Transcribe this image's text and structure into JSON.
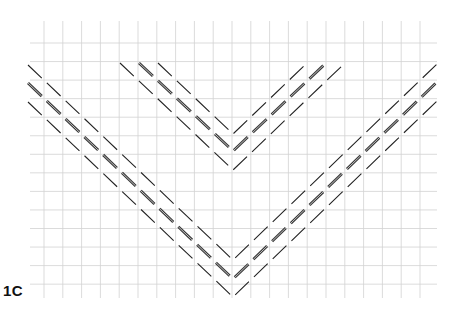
{
  "figure": {
    "label": "1C",
    "background": "#ffffff",
    "grid": {
      "color": "#d2d2d2",
      "vertical_x_start": 44,
      "vertical_spacing": 18.8,
      "vertical_count": 21,
      "vertical_y_range": [
        21,
        298
      ],
      "horizontal_y_start": 43,
      "horizontal_spacing": 18.55,
      "horizontal_count": 14,
      "horizontal_x_range": [
        30,
        437
      ]
    },
    "chevrons": [
      {
        "name": "inner-chevron",
        "lines": [
          {
            "role": "outer",
            "points": [
              [
                120,
                63
              ],
              [
                233,
                170
              ],
              [
                345,
                63
              ]
            ],
            "style": "thin"
          },
          {
            "role": "middle",
            "points": [
              [
                139,
                63
              ],
              [
                233,
                151
              ],
              [
                326,
                63
              ]
            ],
            "style": "double"
          },
          {
            "role": "inner",
            "points": [
              [
                158,
                63
              ],
              [
                233,
                134
              ],
              [
                307,
                63
              ]
            ],
            "style": "thin"
          }
        ]
      },
      {
        "name": "outer-chevron",
        "lines": [
          {
            "role": "top",
            "points": [
              [
                28,
                65
              ],
              [
                233,
                260
              ],
              [
                437,
                64
              ]
            ],
            "style": "thin"
          },
          {
            "role": "middle",
            "points": [
              [
                28,
                83
              ],
              [
                233,
                279
              ],
              [
                437,
                82
              ]
            ],
            "style": "double"
          },
          {
            "role": "bottom",
            "points": [
              [
                28,
                102
              ],
              [
                233,
                297
              ],
              [
                437,
                101
              ]
            ],
            "style": "thin"
          }
        ]
      }
    ],
    "stroke": {
      "color": "#222222",
      "double_outer_color": "#3a3a3a",
      "double_inner_color": "#bdbdbd",
      "dash": "19 7"
    }
  }
}
